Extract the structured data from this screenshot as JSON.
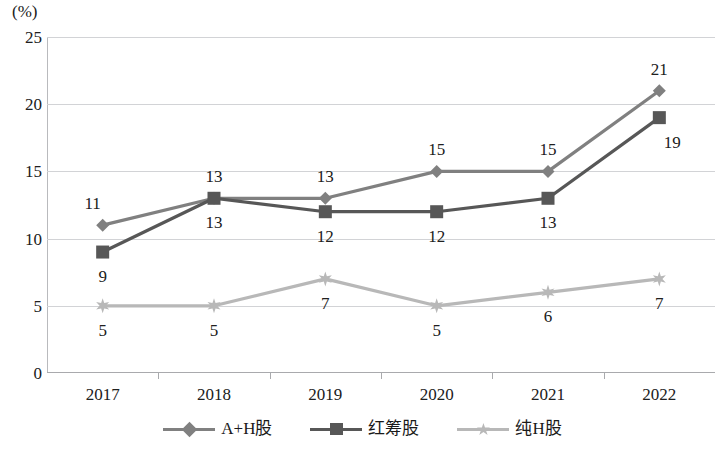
{
  "chart_data": {
    "type": "line",
    "title": "",
    "xlabel": "",
    "ylabel": "(%)",
    "categories": [
      "2017",
      "2018",
      "2019",
      "2020",
      "2021",
      "2022"
    ],
    "ylim": [
      0,
      25
    ],
    "yticks": [
      0,
      5,
      10,
      15,
      20,
      25
    ],
    "grid": true,
    "legend_position": "bottom",
    "series": [
      {
        "name": "A+H股",
        "marker": "diamond",
        "color": "#808080",
        "values": [
          11,
          13,
          13,
          15,
          15,
          21
        ],
        "label_positions": [
          "above-left",
          "above",
          "above",
          "above",
          "above",
          "above"
        ]
      },
      {
        "name": "红筹股",
        "marker": "square",
        "color": "#575757",
        "values": [
          9,
          13,
          12,
          12,
          13,
          19
        ],
        "label_positions": [
          "below",
          "below",
          "below",
          "below",
          "below",
          "below-right"
        ]
      },
      {
        "name": "纯H股",
        "marker": "star",
        "color": "#b8b8b8",
        "values": [
          5,
          5,
          7,
          5,
          6,
          7
        ],
        "label_positions": [
          "below",
          "below",
          "below",
          "below",
          "below",
          "below"
        ]
      }
    ]
  },
  "axis": {
    "unit_label": "(%)",
    "y_ticks": [
      "0",
      "5",
      "10",
      "15",
      "20",
      "25"
    ],
    "x_ticks": [
      "2017",
      "2018",
      "2019",
      "2020",
      "2021",
      "2022"
    ]
  },
  "legend": {
    "items": [
      {
        "label": "A+H股",
        "marker": "diamond-marker",
        "color": "#808080"
      },
      {
        "label": "红筹股",
        "marker": "square-marker",
        "color": "#575757"
      },
      {
        "label": "纯H股",
        "marker": "star-marker",
        "color": "#b8b8b8"
      }
    ]
  },
  "point_labels": {
    "s0": [
      "11",
      "13",
      "13",
      "15",
      "15",
      "21"
    ],
    "s1": [
      "9",
      "13",
      "12",
      "12",
      "13",
      "19"
    ],
    "s2": [
      "5",
      "5",
      "7",
      "5",
      "6",
      "7"
    ]
  }
}
